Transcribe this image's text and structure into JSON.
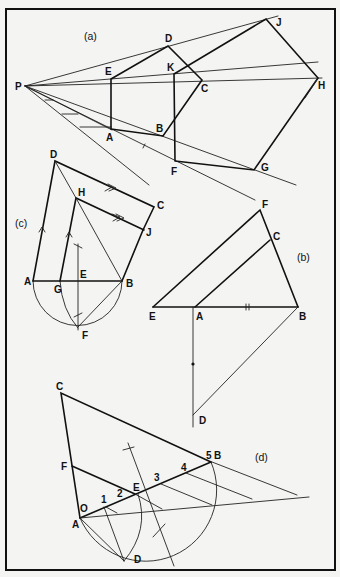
{
  "figure": {
    "panels": [
      {
        "id": "a",
        "caption": "(a)",
        "point_labels": [
          "P",
          "A",
          "B",
          "C",
          "D",
          "E",
          "F",
          "G",
          "H",
          "J",
          "K"
        ]
      },
      {
        "id": "b",
        "caption": "(b)",
        "point_labels": [
          "E",
          "A",
          "B",
          "C",
          "F",
          "D"
        ]
      },
      {
        "id": "c",
        "caption": "(c)",
        "point_labels": [
          "A",
          "G",
          "E",
          "B",
          "D",
          "H",
          "C",
          "J",
          "F"
        ]
      },
      {
        "id": "d",
        "caption": "(d)",
        "point_labels": [
          "C",
          "F",
          "O",
          "A",
          "1",
          "2",
          "E",
          "3",
          "4",
          "5",
          "B",
          "D"
        ]
      }
    ]
  },
  "labels": {
    "a": {
      "caption": "(a)",
      "P": "P",
      "A": "A",
      "B": "B",
      "C": "C",
      "D": "D",
      "E": "E",
      "F": "F",
      "G": "G",
      "H": "H",
      "J": "J",
      "K": "K"
    },
    "b": {
      "caption": "(b)",
      "E": "E",
      "A": "A",
      "B": "B",
      "C": "C",
      "F": "F",
      "D": "D"
    },
    "c": {
      "caption": "(c)",
      "A": "A",
      "G": "G",
      "E": "E",
      "B": "B",
      "D": "D",
      "H": "H",
      "C": "C",
      "J": "J",
      "F": "F"
    },
    "d": {
      "caption": "(d)",
      "C": "C",
      "F": "F",
      "O": "O",
      "A": "A",
      "n1": "1",
      "n2": "2",
      "E": "E",
      "n3": "3",
      "n4": "4",
      "n5": "5",
      "B": "B",
      "D": "D"
    }
  }
}
